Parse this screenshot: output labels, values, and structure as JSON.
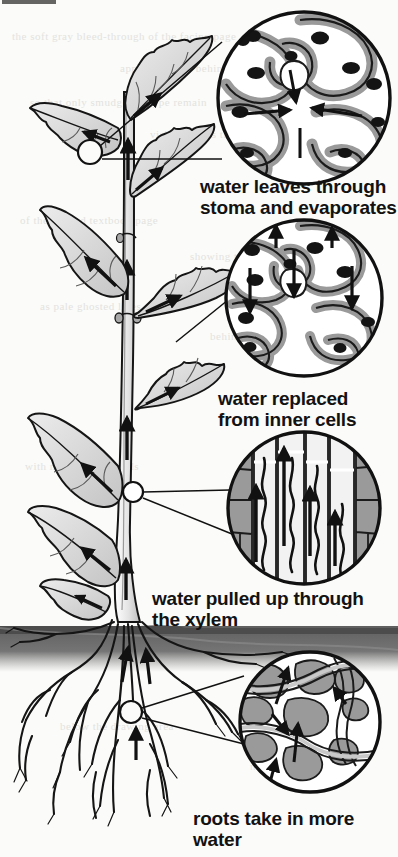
{
  "figure": {
    "title_partial_cut_off_at_top": "stem",
    "background_color": "#fbfbf9",
    "ink_color": "#111111",
    "soil_color": "#6e6e6e",
    "cell_fill_color": "#9a9a9a",
    "leaf_fill_color": "#d9d9d9"
  },
  "ghost_text": [
    {
      "t": "the soft gray bleed-through of the facing page",
      "x": 12,
      "y": 30
    },
    {
      "t": "appears faintly behind the illustration",
      "x": 120,
      "y": 62
    },
    {
      "t": "so that only smudges of type remain",
      "x": 30,
      "y": 96
    },
    {
      "t": "visible across the open margin",
      "x": 150,
      "y": 128
    },
    {
      "t": "of the printed textbook page",
      "x": 20,
      "y": 214
    },
    {
      "t": "showing through the paper",
      "x": 190,
      "y": 250
    },
    {
      "t": "as pale ghosted lines",
      "x": 40,
      "y": 300
    },
    {
      "t": "behind the diagram",
      "x": 210,
      "y": 330
    },
    {
      "t": "with no readable words",
      "x": 25,
      "y": 460
    },
    {
      "t": "remaining on the sheet",
      "x": 230,
      "y": 500
    },
    {
      "t": "below the drawing area",
      "x": 60,
      "y": 720
    },
    {
      "t": "near the lower margin",
      "x": 250,
      "y": 760
    }
  ],
  "callouts": [
    {
      "id": "stoma",
      "label": "water leaves through\nstoma and evaporates",
      "label_x": 200,
      "label_y": 176,
      "circle": {
        "cx": 304,
        "cy": 98,
        "r": 88
      },
      "detail": "epidermal cells surrounding an open stoma with arrows converging on the pore",
      "source_marker": {
        "cx": 90,
        "cy": 152,
        "r": 12
      }
    },
    {
      "id": "inner-cells",
      "label": "water replaced\nfrom inner cells",
      "label_x": 218,
      "label_y": 388,
      "circle": {
        "cx": 304,
        "cy": 298,
        "r": 80
      },
      "detail": "leaf mesophyll cells with downward arrows showing replacement water moving outward",
      "source_marker": null
    },
    {
      "id": "xylem",
      "label": "water pulled up through\nthe xylem",
      "label_x": 152,
      "label_y": 588,
      "circle": {
        "cx": 304,
        "cy": 508,
        "r": 78
      },
      "detail": "stem cross-section: vertical xylem vessels with upward arrows and wavy water columns",
      "source_marker": {
        "cx": 133,
        "cy": 492,
        "r": 10
      }
    },
    {
      "id": "roots",
      "label": "roots take in more\nwater",
      "label_x": 193,
      "label_y": 808,
      "circle": {
        "cx": 310,
        "cy": 722,
        "r": 72
      },
      "detail": "soil particles and root hair with arrows showing water entering the root",
      "source_marker": {
        "cx": 131,
        "cy": 712,
        "r": 11
      }
    }
  ],
  "plant": {
    "stem_arrows": 3,
    "leaf_count": 8,
    "ground_line_y": 626,
    "soil_band_height": 34,
    "description": "upright leafy plant with serrated opposite leaves, arrows in each leaf pointing toward the tip, arrows up the stem, and a fibrous root system below the soil line"
  }
}
